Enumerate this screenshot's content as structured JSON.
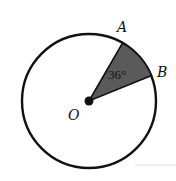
{
  "diagram": {
    "type": "circle-sector",
    "center_label": "O",
    "point_a_label": "A",
    "point_b_label": "B",
    "angle_label": "36°",
    "angle_degrees": 36,
    "colors": {
      "stroke": "#111111",
      "sector_fill": "#5a5a5a",
      "background": "#ffffff"
    }
  }
}
